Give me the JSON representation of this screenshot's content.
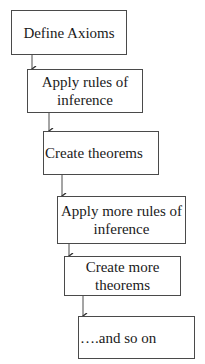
{
  "diagram": {
    "type": "flowchart",
    "direction": "top-to-bottom staircase",
    "line_color": "#4a4a4a",
    "nodes": [
      {
        "id": "n1",
        "label": "Define Axioms"
      },
      {
        "id": "n2",
        "label": "Apply rules of inference"
      },
      {
        "id": "n3",
        "label": "Create theorems"
      },
      {
        "id": "n4",
        "label": "Apply more rules of inference"
      },
      {
        "id": "n5",
        "label": "Create more theorems"
      },
      {
        "id": "n6",
        "label": "….and so on"
      }
    ],
    "edges": [
      {
        "from": "n1",
        "to": "n2"
      },
      {
        "from": "n2",
        "to": "n3"
      },
      {
        "from": "n3",
        "to": "n4"
      },
      {
        "from": "n4",
        "to": "n5"
      },
      {
        "from": "n5",
        "to": "n6"
      }
    ]
  }
}
